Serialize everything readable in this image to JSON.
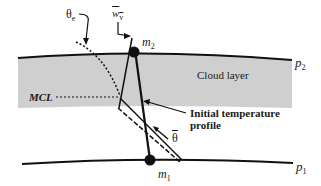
{
  "diagram": {
    "labels": {
      "theta_e": "θ",
      "theta_e_sub": "e",
      "w_v": "w",
      "w_v_sub": "v",
      "m2": "m",
      "m2_sub": "2",
      "m1": "m",
      "m1_sub": "1",
      "p2": "p",
      "p2_sub": "2",
      "p1": "p",
      "p1_sub": "1",
      "cloud_layer": "Cloud layer",
      "mcl": "MCL",
      "initial_temp_line1": "Initial temperature",
      "initial_temp_line2": "profile",
      "theta_bar": "θ"
    },
    "colors": {
      "line": "#111111",
      "cloud_fill": "#cfcfcf",
      "background": "#ffffff"
    }
  }
}
